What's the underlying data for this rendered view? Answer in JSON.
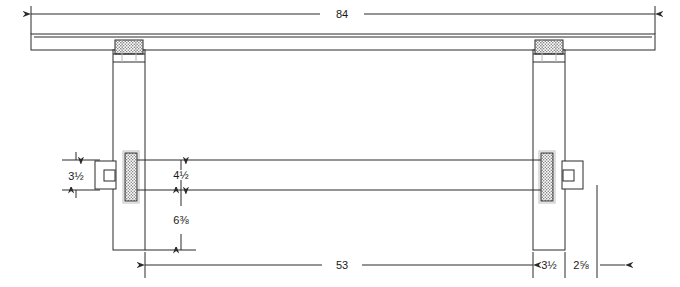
{
  "drawing": {
    "title": "Trestle table front elevation",
    "units": "inches",
    "line_color": "#2b2b2b",
    "hatch_color": "#9a9a9a",
    "background": "#ffffff"
  },
  "dimensions": [
    {
      "id": "overall-width",
      "label": "84",
      "orientation": "horizontal",
      "position": "top",
      "describes": "overall tabletop width"
    },
    {
      "id": "stretcher-height",
      "label": "3½",
      "orientation": "vertical",
      "position": "left",
      "describes": "stretcher rail height"
    },
    {
      "id": "tenon-offset",
      "label": "4½",
      "orientation": "vertical",
      "position": "inner-left",
      "describes": "distance above stretcher"
    },
    {
      "id": "stretcher-to-floor",
      "label": "6⅜",
      "orientation": "vertical",
      "position": "inner-left",
      "describes": "stretcher underside to leg bottom"
    },
    {
      "id": "between-legs",
      "label": "53",
      "orientation": "horizontal",
      "position": "bottom",
      "describes": "inside span between legs"
    },
    {
      "id": "leg-width",
      "label": "3½",
      "orientation": "horizontal",
      "position": "bottom",
      "describes": "leg thickness"
    },
    {
      "id": "top-overhang",
      "label": "2⅝",
      "orientation": "horizontal",
      "position": "bottom",
      "describes": "tabletop overhang past leg"
    }
  ],
  "parts": [
    {
      "id": "tabletop",
      "name": "tabletop slab"
    },
    {
      "id": "leg-left",
      "name": "left leg post"
    },
    {
      "id": "leg-right",
      "name": "right leg post"
    },
    {
      "id": "tenon-top-left",
      "name": "left leg top tenon"
    },
    {
      "id": "tenon-top-right",
      "name": "right leg top tenon"
    },
    {
      "id": "stretcher",
      "name": "stretcher rail"
    },
    {
      "id": "wedge-left",
      "name": "left through-tenon wedge"
    },
    {
      "id": "wedge-right",
      "name": "right through-tenon wedge"
    },
    {
      "id": "tenon-end-left",
      "name": "left protruding tenon end"
    },
    {
      "id": "tenon-end-right",
      "name": "right protruding tenon end"
    }
  ]
}
